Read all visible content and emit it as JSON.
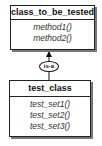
{
  "diagram": {
    "type": "uml-class",
    "classes": [
      {
        "name": "class_to_be_tested",
        "methods": [
          "method1()",
          "method2()"
        ]
      },
      {
        "name": "test_class",
        "methods": [
          "test_set1()",
          "test_set2()",
          "test_set3()"
        ]
      }
    ],
    "relationships": [
      {
        "from": "test_class",
        "to": "class_to_be_tested",
        "label": "is-a"
      }
    ]
  }
}
